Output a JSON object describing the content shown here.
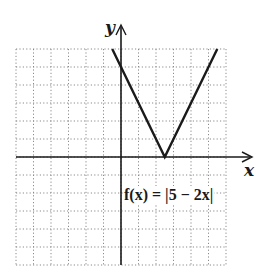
{
  "chart_data": {
    "type": "line",
    "title": "",
    "function": "f(x) = |5 − 2x|",
    "xlabel": "x",
    "ylabel": "y",
    "xlim": [
      -6,
      6
    ],
    "ylim": [
      -6,
      6
    ],
    "grid": true,
    "grid_style": "dotted",
    "grid_step": 1,
    "series": [
      {
        "name": "f(x) = |5 − 2x|",
        "points": [
          [
            -0.5,
            6
          ],
          [
            0,
            5
          ],
          [
            2.5,
            0
          ],
          [
            5.5,
            6
          ]
        ]
      }
    ],
    "annotations": [
      {
        "text": "f(x) = |5 − 2x|",
        "x": 0.1,
        "y": -2.5
      }
    ],
    "colors": {
      "line": "#1a1a1a",
      "axis": "#1a1a1a",
      "grid": "#8a8a8a"
    }
  },
  "labels": {
    "x_axis": "x",
    "y_axis": "y",
    "function": "f(x) = |5 − 2x|"
  }
}
